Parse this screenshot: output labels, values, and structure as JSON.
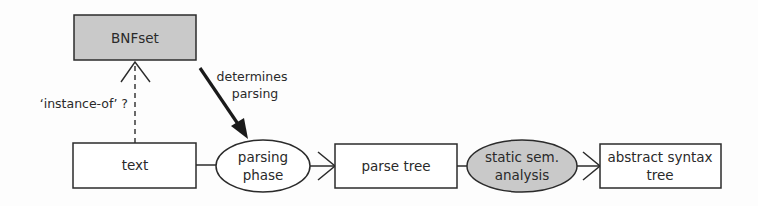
{
  "diagram": {
    "nodes": {
      "bnfset": {
        "label": "BNFset",
        "shape": "rectangle",
        "fill": "#c9c9c9"
      },
      "text": {
        "label": "text",
        "shape": "rectangle",
        "fill": "#ffffff"
      },
      "parsing_phase": {
        "line1": "parsing",
        "line2": "phase",
        "shape": "ellipse",
        "fill": "#ffffff"
      },
      "parse_tree": {
        "label": "parse tree",
        "shape": "rectangle",
        "fill": "#ffffff"
      },
      "static_sem": {
        "line1": "static sem.",
        "line2": "analysis",
        "shape": "ellipse",
        "fill": "#c9c9c9"
      },
      "ast": {
        "line1": "abstract syntax",
        "line2": "tree",
        "shape": "rectangle",
        "fill": "#ffffff"
      }
    },
    "edges": {
      "instance_of": {
        "from": "text",
        "to": "bnfset",
        "style": "dashed",
        "label": "‘instance-of’ ?"
      },
      "determines": {
        "from": "bnfset",
        "to": "parsing_phase",
        "style": "thick-solid",
        "line1": "determines",
        "line2": "parsing"
      },
      "text_to_parsing": {
        "from": "text",
        "to": "parsing_phase",
        "style": "line"
      },
      "parsing_to_parsetree": {
        "from": "parsing_phase",
        "to": "parse_tree",
        "style": "open-arrow"
      },
      "parsetree_to_static": {
        "from": "parse_tree",
        "to": "static_sem",
        "style": "line"
      },
      "static_to_ast": {
        "from": "static_sem",
        "to": "ast",
        "style": "open-arrow"
      }
    },
    "colors": {
      "stroke": "#2b2b2b",
      "gray_fill": "#c9c9c9",
      "white_fill": "#ffffff"
    }
  }
}
